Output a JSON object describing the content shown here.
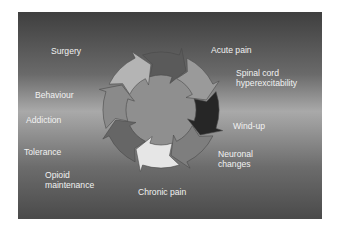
{
  "diagram": {
    "type": "cycle",
    "direction": "clockwise",
    "center": {
      "x": 143,
      "y": 98
    },
    "radius_outer": 58,
    "radius_inner": 35,
    "segments": [
      {
        "id": "top",
        "color": "#5a5a5a"
      },
      {
        "id": "top-right",
        "color": "#9a9a9a"
      },
      {
        "id": "right",
        "color": "#262626"
      },
      {
        "id": "bottom-right",
        "color": "#7e7e7e"
      },
      {
        "id": "bottom",
        "color": "#e6e6e6"
      },
      {
        "id": "bottom-left",
        "color": "#666666"
      },
      {
        "id": "left",
        "color": "#8a8a8a"
      },
      {
        "id": "top-left",
        "color": "#b4b4b4"
      }
    ],
    "center_color": "#8f8f8f"
  },
  "labels": {
    "surgery": "Surgery",
    "acute_pain": "Acute pain",
    "spinal_cord_line1": "Spinal cord",
    "spinal_cord_line2": "hyperexcitability",
    "wind_up": "Wind-up",
    "neuronal_line1": "Neuronal",
    "neuronal_line2": "changes",
    "chronic_pain": "Chronic pain",
    "opioid_line1": "Opioid",
    "opioid_line2": "maintenance",
    "tolerance": "Tolerance",
    "addiction": "Addiction",
    "behaviour": "Behaviour"
  }
}
